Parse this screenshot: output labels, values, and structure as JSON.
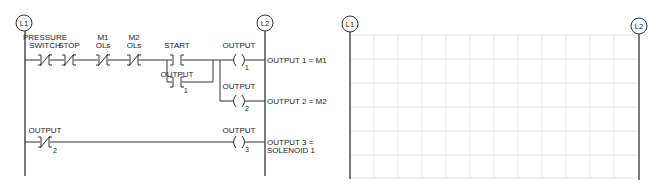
{
  "left_diagram": {
    "rails": {
      "left": "L1",
      "right": "L2"
    },
    "rungs": [
      {
        "contacts": [
          {
            "label_line1": "PRESSURE",
            "label_line2": "SWITCH",
            "type": "normally-closed"
          },
          {
            "label_line1": "",
            "label_line2": "STOP",
            "type": "normally-closed"
          },
          {
            "label_line1": "M1",
            "label_line2": "OLs",
            "type": "normally-closed"
          },
          {
            "label_line1": "M2",
            "label_line2": "OLs",
            "type": "normally-closed"
          },
          {
            "label_line1": "",
            "label_line2": "START",
            "type": "normally-open"
          }
        ],
        "branch_contact": {
          "label": "OUTPUT",
          "subscript": "1",
          "type": "normally-open"
        },
        "coils": [
          {
            "label": "OUTPUT",
            "subscript": "1",
            "annotation": "OUTPUT 1 = M1"
          },
          {
            "label": "OUTPUT",
            "subscript": "2",
            "annotation": "OUTPUT 2 = M2"
          }
        ]
      },
      {
        "contacts": [
          {
            "label": "OUTPUT",
            "subscript": "2",
            "type": "normally-closed"
          }
        ],
        "coils": [
          {
            "label": "OUTPUT",
            "subscript": "3",
            "annotation_line1": "OUTPUT 3 =",
            "annotation_line2": "SOLENOID 1"
          }
        ]
      }
    ]
  },
  "right_diagram": {
    "rails": {
      "left": "L1",
      "right": "L2"
    },
    "grid": {
      "columns": 12,
      "rows": 6,
      "note": "blank ladder grid for student completion"
    }
  },
  "colors": {
    "line": "#333333",
    "grid": "#e2e2e2",
    "background": "#ffffff"
  }
}
